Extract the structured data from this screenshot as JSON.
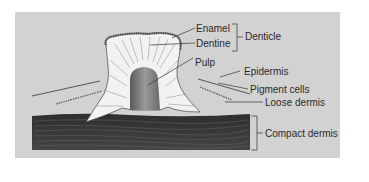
{
  "diagram": {
    "type": "anatomical cross-section",
    "colors": {
      "background": "#ffffff",
      "panel": "#d2d2d2",
      "compact_dermis": "#3a3a3a",
      "denticle_fill": "#f2f2f2",
      "pulp": "#7a7a7a",
      "enamel": "#555555",
      "label_text": "#2a2a2a"
    },
    "labels": {
      "enamel": "Enamel",
      "dentine": "Dentine",
      "denticle": "Denticle",
      "pulp": "Pulp",
      "epidermis": "Epidermis",
      "pigment_cells": "Pigment cells",
      "loose_dermis": "Loose dermis",
      "compact_dermis": "Compact dermis"
    },
    "groups": [
      {
        "bracket": "Denticle",
        "members": [
          "Enamel",
          "Dentine"
        ]
      },
      {
        "bracket": "Compact dermis",
        "members": []
      }
    ]
  }
}
